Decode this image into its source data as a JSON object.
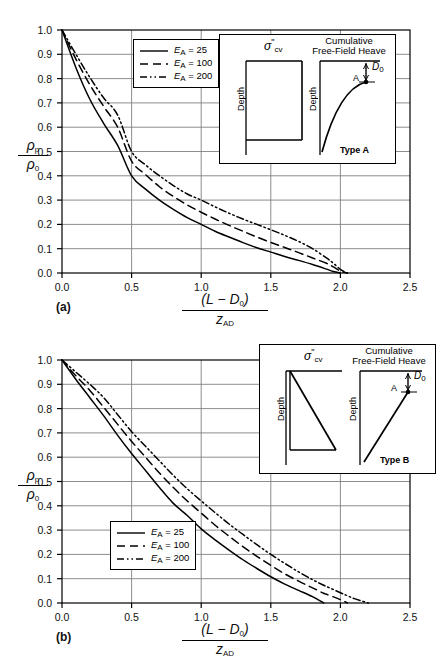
{
  "figure": {
    "panels": [
      {
        "tag": "(a)",
        "type_label": "Type A",
        "inset": {
          "stress_symbol": "σ",
          "stress_primes": "\"",
          "stress_sub": "cv",
          "heave_title_line1": "Cumulative",
          "heave_title_line2": "Free-Field Heave",
          "depth_label": "Depth",
          "point_label": "A",
          "d0_symbol": "D",
          "d0_sub": "0"
        }
      },
      {
        "tag": "(b)",
        "type_label": "Type B",
        "inset": {
          "stress_symbol": "σ",
          "stress_primes": "\"",
          "stress_sub": "cv",
          "heave_title_line1": "Cumulative",
          "heave_title_line2": "Free-Field Heave",
          "depth_label": "Depth",
          "point_label": "A",
          "d0_symbol": "D",
          "d0_sub": "0"
        }
      }
    ],
    "axis": {
      "y_label_num": "ρ",
      "y_label_num_sub": "p",
      "y_label_den": "ρ",
      "y_label_den_sub": "0",
      "x_label_num": "(L − D",
      "x_label_num_sub": "0",
      "x_label_num_end": ")",
      "x_label_den": "z",
      "x_label_den_sub": "AD"
    },
    "legend": {
      "entries": [
        {
          "label_var": "E",
          "label_sub": "A",
          "label_val": "= 25",
          "style": "solid"
        },
        {
          "label_var": "E",
          "label_sub": "A",
          "label_val": "= 100",
          "style": "dashed"
        },
        {
          "label_var": "E",
          "label_sub": "A",
          "label_val": "= 200",
          "style": "dashdotdot"
        }
      ]
    },
    "colors": {
      "line": "#000000",
      "grid": "#808080",
      "axis": "#000000",
      "background": "#ffffff"
    }
  },
  "chart_data": [
    {
      "type": "line",
      "panel": "(a)",
      "title": "",
      "xlabel": "(L - D0)/z_AD",
      "ylabel": "rho_p / rho_0",
      "xlim": [
        0.0,
        2.5
      ],
      "ylim": [
        0.0,
        1.0
      ],
      "xticks": [
        "0.0",
        "0.5",
        "1.0",
        "1.5",
        "2.0",
        "2.5"
      ],
      "yticks": [
        "0.0",
        "0.1",
        "0.2",
        "0.3",
        "0.4",
        "0.5",
        "0.6",
        "0.7",
        "0.8",
        "0.9",
        "1.0"
      ],
      "grid": true,
      "legend_position": "upper-left-inside",
      "x": [
        0.0,
        0.1,
        0.2,
        0.3,
        0.4,
        0.5,
        0.6,
        0.7,
        0.8,
        0.9,
        1.0,
        1.1,
        1.2,
        1.3,
        1.4,
        1.5,
        1.6,
        1.7,
        1.8,
        1.9,
        1.95,
        2.0,
        2.05
      ],
      "series": [
        {
          "name": "E_A = 25",
          "style": "solid",
          "values": [
            1.0,
            0.845,
            0.715,
            0.615,
            0.525,
            0.4,
            0.345,
            0.3,
            0.262,
            0.228,
            0.2,
            0.172,
            0.148,
            0.125,
            0.104,
            0.086,
            0.068,
            0.052,
            0.035,
            0.016,
            0.006,
            0.0,
            null
          ]
        },
        {
          "name": "E_A = 100",
          "style": "dashed",
          "values": [
            1.0,
            0.88,
            0.775,
            0.685,
            0.6,
            0.46,
            0.405,
            0.355,
            0.315,
            0.28,
            0.25,
            0.222,
            0.196,
            0.172,
            0.148,
            0.126,
            0.105,
            0.084,
            0.062,
            0.04,
            0.025,
            0.008,
            0.0
          ]
        },
        {
          "name": "E_A = 200",
          "style": "dashdotdot",
          "values": [
            1.0,
            0.9,
            0.805,
            0.72,
            0.65,
            0.5,
            0.445,
            0.4,
            0.36,
            0.325,
            0.3,
            0.272,
            0.246,
            0.222,
            0.2,
            0.178,
            0.155,
            0.13,
            0.1,
            0.062,
            0.04,
            0.015,
            0.0
          ]
        }
      ]
    },
    {
      "type": "line",
      "panel": "(b)",
      "title": "",
      "xlabel": "(L - D0)/z_AD",
      "ylabel": "rho_p / rho_0",
      "xlim": [
        0.0,
        2.5
      ],
      "ylim": [
        0.0,
        1.0
      ],
      "xticks": [
        "0.0",
        "0.5",
        "1.0",
        "1.5",
        "2.0",
        "2.5"
      ],
      "yticks": [
        "0.0",
        "0.1",
        "0.2",
        "0.3",
        "0.4",
        "0.5",
        "0.6",
        "0.7",
        "0.8",
        "0.9",
        "1.0"
      ],
      "grid": true,
      "legend_position": "lower-left-inside",
      "x": [
        0.0,
        0.1,
        0.2,
        0.3,
        0.4,
        0.5,
        0.6,
        0.7,
        0.8,
        0.9,
        1.0,
        1.1,
        1.2,
        1.3,
        1.4,
        1.5,
        1.6,
        1.7,
        1.8,
        1.88,
        1.9,
        2.0,
        2.05,
        2.1,
        2.2
      ],
      "series": [
        {
          "name": "E_A = 25",
          "style": "solid",
          "values": [
            1.0,
            0.92,
            0.845,
            0.77,
            0.69,
            0.615,
            0.545,
            0.475,
            0.41,
            0.36,
            0.305,
            0.26,
            0.218,
            0.178,
            0.142,
            0.108,
            0.078,
            0.052,
            0.026,
            0.0,
            null,
            null,
            null,
            null,
            null
          ]
        },
        {
          "name": "E_A = 100",
          "style": "dashed",
          "values": [
            1.0,
            0.935,
            0.875,
            0.805,
            0.735,
            0.665,
            0.6,
            0.535,
            0.475,
            0.42,
            0.37,
            0.32,
            0.275,
            0.232,
            0.192,
            0.155,
            0.12,
            0.09,
            0.062,
            0.04,
            0.036,
            0.014,
            0.0,
            null,
            null
          ]
        },
        {
          "name": "E_A = 200",
          "style": "dashdotdot",
          "values": [
            1.0,
            0.95,
            0.9,
            0.845,
            0.775,
            0.705,
            0.645,
            0.585,
            0.525,
            0.47,
            0.42,
            0.372,
            0.325,
            0.282,
            0.24,
            0.2,
            0.163,
            0.128,
            0.096,
            0.073,
            0.068,
            0.042,
            0.03,
            0.018,
            0.0
          ]
        }
      ]
    }
  ]
}
